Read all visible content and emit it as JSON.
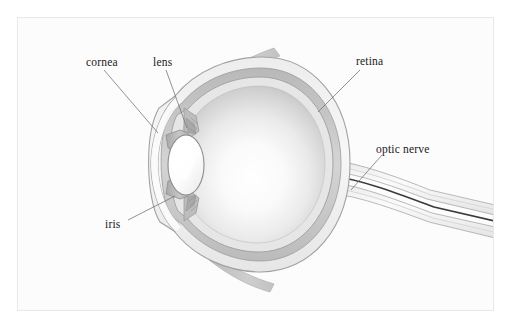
{
  "figure": {
    "background_color": "#ffffff",
    "plate_color": "#fcfcfc",
    "border_color": "#e8e8e8",
    "width": 513,
    "height": 329
  },
  "labels": [
    {
      "id": "cornea",
      "text": "cornea",
      "x": 86,
      "y": 56,
      "leader_to": "corneal arc, anterior eye"
    },
    {
      "id": "lens",
      "text": "lens",
      "x": 153,
      "y": 56,
      "leader_to": "crystalline lens"
    },
    {
      "id": "retina",
      "text": "retina",
      "x": 356,
      "y": 55,
      "leader_to": "posterior inner wall"
    },
    {
      "id": "optic-nerve",
      "text": "optic nerve",
      "x": 376,
      "y": 143,
      "leader_to": "nerve trunk, right"
    },
    {
      "id": "iris",
      "text": "iris",
      "x": 105,
      "y": 218,
      "leader_to": "lower iris leaf"
    }
  ],
  "structures": [
    {
      "id": "globe",
      "name": "eyeball globe",
      "color": "#f2f2f2"
    },
    {
      "id": "vitreous",
      "name": "vitreous body",
      "color": "#ffffff"
    },
    {
      "id": "sclera",
      "name": "sclera outer coat",
      "color": "#f4f4f4"
    },
    {
      "id": "choroid",
      "name": "choroid layer",
      "color": "#c9c9c9"
    },
    {
      "id": "retina-layer",
      "name": "retina inner layer",
      "color": "#e2e2e2"
    },
    {
      "id": "cornea",
      "name": "cornea",
      "color": "#fbfbfb"
    },
    {
      "id": "lens",
      "name": "crystalline lens",
      "color": "#fdfdfd"
    },
    {
      "id": "iris-upper",
      "name": "upper iris leaf",
      "color": "#b9b9b9"
    },
    {
      "id": "iris-lower",
      "name": "lower iris leaf",
      "color": "#b9b9b9"
    },
    {
      "id": "ciliary-upper",
      "name": "upper ciliary body",
      "color": "#b0b0b0"
    },
    {
      "id": "ciliary-lower",
      "name": "lower ciliary body",
      "color": "#b0b0b0"
    },
    {
      "id": "muscle-upper",
      "name": "superior rectus tendon",
      "color": "#c4c4c4"
    },
    {
      "id": "muscle-lower",
      "name": "inferior rectus tendon",
      "color": "#c4c4c4"
    },
    {
      "id": "optic-nerve",
      "name": "optic nerve trunk",
      "color": "#f0f0f0"
    },
    {
      "id": "nerve-core",
      "name": "optic nerve core line",
      "color": "#3a3a3a"
    }
  ],
  "colors": {
    "ink": "#1a1a1a",
    "leader_line": "#6f6f6f",
    "outline": "#9a9a9a",
    "outline_soft": "#b5b5b5",
    "shade_dark": "#8e8e8e",
    "shade_mid": "#c0c0c0",
    "shade_light": "#e6e6e6"
  }
}
